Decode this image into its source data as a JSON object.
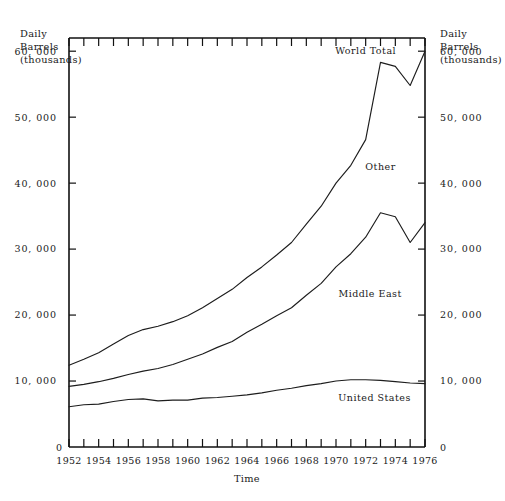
{
  "chart_data": {
    "type": "line",
    "title": "",
    "xlabel": "Time",
    "ylabel": "Daily Barrels (thousands)",
    "ylabel_left_lines": [
      "Daily",
      "Barrels",
      "(thousands)"
    ],
    "ylabel_right_lines": [
      "Daily",
      "Barrels",
      "(thousands)"
    ],
    "xlim": [
      1952,
      1976
    ],
    "ylim": [
      0,
      62000
    ],
    "grid": false,
    "legend_position": "inline-annotations",
    "ytick_labels": [
      "60, 000",
      "50, 000",
      "40, 000",
      "30, 000",
      "20, 000",
      "10, 000",
      "0"
    ],
    "ytick_values": [
      60000,
      50000,
      40000,
      30000,
      20000,
      10000,
      0
    ],
    "xtick_labels": [
      "1952",
      "1954",
      "1956",
      "1958",
      "1960",
      "1962",
      "1964",
      "1966",
      "1968",
      "1970",
      "1972",
      "1974",
      "1976"
    ],
    "xtick_values": [
      1952,
      1954,
      1956,
      1958,
      1960,
      1962,
      1964,
      1966,
      1968,
      1970,
      1972,
      1974,
      1976
    ],
    "xtick_minor_step": 1,
    "x": [
      1952,
      1953,
      1954,
      1955,
      1956,
      1957,
      1958,
      1959,
      1960,
      1961,
      1962,
      1963,
      1964,
      1965,
      1966,
      1967,
      1968,
      1969,
      1970,
      1971,
      1972,
      1973,
      1974,
      1975,
      1976
    ],
    "series": [
      {
        "name": "World Total",
        "label": "World Total",
        "values": [
          12400,
          13300,
          14300,
          15600,
          16900,
          17800,
          18300,
          19000,
          19900,
          21100,
          22500,
          23900,
          25700,
          27300,
          29100,
          31000,
          33800,
          36500,
          40000,
          42700,
          46600,
          58300,
          57700,
          54800,
          60000
        ]
      },
      {
        "name": "Other",
        "label": "Other",
        "values": [
          null,
          null,
          null,
          null,
          null,
          null,
          null,
          null,
          null,
          null,
          null,
          null,
          null,
          null,
          null,
          null,
          null,
          null,
          null,
          null,
          null,
          null,
          null,
          null,
          null
        ]
      },
      {
        "name": "Middle East",
        "label": "Middle East",
        "values": [
          9200,
          9500,
          9900,
          10400,
          11000,
          11500,
          11900,
          12500,
          13300,
          14100,
          15100,
          16000,
          17400,
          18600,
          19900,
          21100,
          23000,
          24800,
          27300,
          29300,
          31800,
          35500,
          34900,
          31000,
          34000
        ]
      },
      {
        "name": "United States",
        "label": "United States",
        "values": [
          6100,
          6400,
          6500,
          6900,
          7200,
          7300,
          7000,
          7100,
          7100,
          7400,
          7500,
          7700,
          7900,
          8200,
          8600,
          8900,
          9300,
          9600,
          10000,
          10200,
          10200,
          10100,
          9900,
          9700,
          9600
        ]
      }
    ],
    "annotations": [
      {
        "text": "World Total",
        "x": 1972.0,
        "y": 59500
      },
      {
        "text": "Other",
        "x": 1973.0,
        "y": 42000
      },
      {
        "text": "Middle East",
        "x": 1972.3,
        "y": 22800
      },
      {
        "text": "United States",
        "x": 1972.6,
        "y": 7000
      }
    ]
  },
  "axes": {
    "left_caption": "Daily\nBarrels\n(thousands)",
    "right_caption": "Daily\nBarrels\n(thousands)",
    "x_caption": "Time",
    "zero_left": "0",
    "zero_right": "0"
  },
  "colors": {
    "line": "#1d1d1d",
    "axis": "#111111",
    "background": "#ffffff",
    "text": "#1a1a1a"
  }
}
